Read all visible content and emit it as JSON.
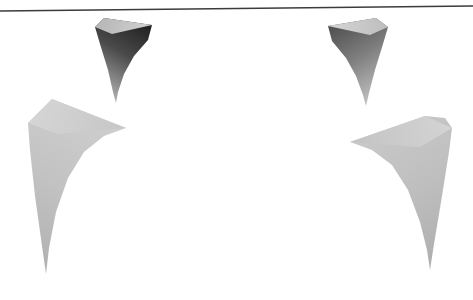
{
  "figure": {
    "background_color": "#ffffff",
    "width": 473,
    "height": 300,
    "caption": ""
  },
  "chart_data": {
    "type": "surface-fragments",
    "title": "",
    "subtitle": "",
    "xlabel": "",
    "ylabel": "",
    "grid": false,
    "legend": null,
    "axes_visible": false,
    "tick_labels": [],
    "annotations": [],
    "background": "#ffffff",
    "viewport": {
      "x": 0,
      "y": 0,
      "width": 473,
      "height": 300
    },
    "horizon_line": {
      "name": "top-horizon-rule",
      "x1": 0,
      "y1": 11,
      "x2": 473,
      "y2": 6,
      "thickness": 1.6,
      "color": "#3c3c3c"
    },
    "fragments": [
      {
        "name": "upper-left-dark-horn",
        "shade": "dark",
        "fill_start": "#1d1d1d",
        "fill_end": "#b9b9b9",
        "gradient_angle_deg": 150,
        "highlight_fill": "#c9c9c9",
        "bbox": [
          92,
          16,
          152,
          103
        ],
        "apex": [
          108,
          18
        ],
        "tip": [
          116,
          103
        ],
        "outline": "M 104 18 L 152 25 L 148 40 L 134 56 L 124 74 L 118 92 L 116 103 L 113 92 L 108 70 L 100 44 L 95 27 Z",
        "highlight": "M 104 18 L 152 25 L 112 34 L 95 27 Z"
      },
      {
        "name": "upper-right-dark-horn",
        "shade": "dark",
        "fill_start": "#5a5a5a",
        "fill_end": "#c6c6c6",
        "gradient_angle_deg": 210,
        "highlight_fill": "#cfcfcf",
        "bbox": [
          326,
          16,
          390,
          106
        ],
        "apex": [
          372,
          18
        ],
        "tip": [
          366,
          106
        ],
        "outline": "M 376 18 L 328 26 L 332 41 L 346 58 L 356 76 L 363 95 L 366 106 L 369 93 L 375 70 L 383 44 L 388 27 Z",
        "highlight": "M 376 18 L 328 26 L 370 35 L 388 27 Z"
      },
      {
        "name": "lower-left-light-horn",
        "shade": "light",
        "fill_start": "#cfcfcf",
        "fill_end": "#b3b3b3",
        "gradient_angle_deg": 120,
        "highlight_fill": "#d4d4d4",
        "bbox": [
          27,
          98,
          126,
          274
        ],
        "apex": [
          52,
          99
        ],
        "tip": [
          46,
          274
        ],
        "outline": "M 52 99 L 126 128 L 104 136 L 84 152 L 68 178 L 56 212 L 49 248 L 46 274 L 42 246 L 35 196 L 30 150 L 28 123 Z",
        "highlight": "M 52 99 L 126 128 L 58 134 L 28 123 Z"
      },
      {
        "name": "lower-right-light-horn",
        "shade": "light",
        "fill_start": "#c9c9c9",
        "fill_end": "#b0b0b0",
        "gradient_angle_deg": 240,
        "highlight_fill": "#d2d2d2",
        "bbox": [
          349,
          115,
          456,
          270
        ],
        "apex": [
          425,
          116
        ],
        "tip": [
          430,
          270
        ],
        "outline": "M 425 116 L 350 142 L 372 150 L 392 165 L 408 190 L 420 222 L 427 250 L 430 270 L 434 244 L 442 196 L 449 152 L 452 128 L 445 118 Z",
        "highlight": "M 425 116 L 350 142 L 420 147 L 452 128 Z"
      }
    ],
    "palette": {
      "darkest": "#1d1d1d",
      "mid_dark": "#5a5a5a",
      "mid_light": "#b9b9b9",
      "lightest": "#d4d4d4",
      "line": "#3c3c3c",
      "background": "#ffffff"
    }
  }
}
